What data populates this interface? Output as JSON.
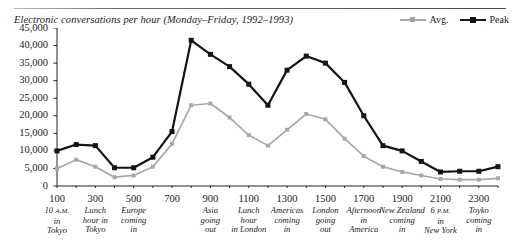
{
  "title": "Electronic conversations per hour (Monday–Friday, 1992–1993)",
  "legend": [
    {
      "label": "Avg.",
      "color": "#a8a8a8",
      "name": "legend-avg"
    },
    {
      "label": "Peak",
      "color": "#141414",
      "name": "legend-peak"
    }
  ],
  "axes": {
    "y_ticks": [
      "45,000",
      "40,000",
      "35,000",
      "30,000",
      "25,000",
      "20,000",
      "15,000",
      "10,000",
      "5,000",
      "0"
    ],
    "y_min": 0,
    "y_max": 45000,
    "y_step": 5000,
    "x_min": 100,
    "x_max": 2400,
    "x_tick_step": 100,
    "x_label_step": 200,
    "x_labels": [
      "100",
      "300",
      "500",
      "700",
      "900",
      "1100",
      "1300",
      "1500",
      "1700",
      "1900",
      "2100",
      "2300"
    ]
  },
  "annotations": [
    {
      "at": 100,
      "lines": [
        "10 A.M.",
        "in",
        "Tokyo"
      ],
      "smallcaps_line": 0
    },
    {
      "at": 300,
      "lines": [
        "Lunch",
        "hour in",
        "Tokyo"
      ]
    },
    {
      "at": 500,
      "lines": [
        "Europe",
        "coming",
        "in"
      ]
    },
    {
      "at": 900,
      "lines": [
        "Asia",
        "going",
        "out"
      ]
    },
    {
      "at": 1100,
      "lines": [
        "Lunch",
        "hour",
        "in London"
      ]
    },
    {
      "at": 1300,
      "lines": [
        "Americas",
        "coming",
        "in"
      ]
    },
    {
      "at": 1500,
      "lines": [
        "London",
        "going",
        "out"
      ]
    },
    {
      "at": 1700,
      "lines": [
        "Afternoon",
        "in",
        "America"
      ]
    },
    {
      "at": 1900,
      "lines": [
        "New Zealand",
        "coming",
        "in"
      ]
    },
    {
      "at": 2100,
      "lines": [
        "6 P.M.",
        "in",
        "New York"
      ],
      "smallcaps_line": 0
    },
    {
      "at": 2300,
      "lines": [
        "Toyko",
        "coming",
        "in"
      ]
    }
  ],
  "chart_data": {
    "type": "line",
    "title": "Electronic conversations per hour (Monday–Friday, 1992–1993)",
    "xlabel": "",
    "ylabel": "",
    "xlim": [
      100,
      2400
    ],
    "ylim": [
      0,
      45000
    ],
    "grid": false,
    "legend_position": "top-right",
    "x": [
      100,
      200,
      300,
      400,
      500,
      600,
      700,
      800,
      900,
      1000,
      1100,
      1200,
      1300,
      1400,
      1500,
      1600,
      1700,
      1800,
      1900,
      2000,
      2100,
      2200,
      2300,
      2400
    ],
    "series": [
      {
        "name": "Avg.",
        "color": "#a8a8a8",
        "values": [
          5000,
          7500,
          5500,
          2500,
          3000,
          5500,
          12000,
          23000,
          23500,
          19500,
          14500,
          11500,
          16000,
          20500,
          19000,
          13500,
          8500,
          5500,
          4000,
          3000,
          2000,
          1800,
          1800,
          2200
        ]
      },
      {
        "name": "Peak",
        "color": "#141414",
        "values": [
          10000,
          11800,
          11500,
          5200,
          5200,
          8200,
          15500,
          41500,
          37500,
          34000,
          29000,
          23000,
          33000,
          37000,
          35000,
          29500,
          20000,
          11500,
          10000,
          7000,
          4000,
          4200,
          4200,
          5500
        ]
      }
    ]
  }
}
